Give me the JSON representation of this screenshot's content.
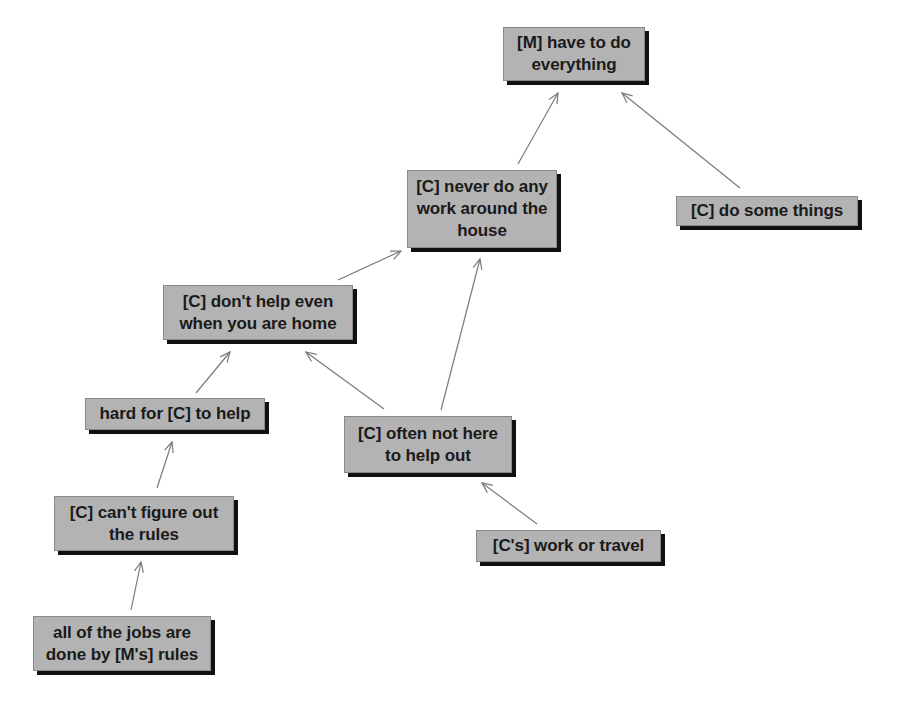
{
  "diagram": {
    "type": "concept-map",
    "colors": {
      "node_fill": "#b3b3b3",
      "node_shadow": "#111111",
      "edge": "#7a7a7a",
      "text": "#1a1a1a"
    },
    "nodes": [
      {
        "id": "n1",
        "label": "[M] have to do everything",
        "lines": [
          "[M] have to do",
          "everything"
        ],
        "x": 503,
        "y": 27,
        "w": 142,
        "h": 54
      },
      {
        "id": "n2",
        "label": "[C] never do any work around the house",
        "lines": [
          "[C] never do any",
          "work around the",
          "house"
        ],
        "x": 407,
        "y": 170,
        "w": 150,
        "h": 78
      },
      {
        "id": "n3",
        "label": "[C] do some things",
        "lines": [
          "[C] do some things"
        ],
        "x": 676,
        "y": 196,
        "w": 182,
        "h": 30
      },
      {
        "id": "n4",
        "label": "[C] don't help even when you are home",
        "lines": [
          "[C] don't help even",
          "when you are home"
        ],
        "x": 163,
        "y": 285,
        "w": 190,
        "h": 55
      },
      {
        "id": "n5",
        "label": "hard for [C] to help",
        "lines": [
          "hard for [C] to help"
        ],
        "x": 85,
        "y": 398,
        "w": 180,
        "h": 32
      },
      {
        "id": "n6",
        "label": "[C] often not here to help out",
        "lines": [
          "[C] often not here",
          "to help out"
        ],
        "x": 344,
        "y": 416,
        "w": 168,
        "h": 57
      },
      {
        "id": "n7",
        "label": "[C] can't figure out the rules",
        "lines": [
          "[C] can't figure out",
          "the rules"
        ],
        "x": 54,
        "y": 496,
        "w": 180,
        "h": 55
      },
      {
        "id": "n8",
        "label": "[C's] work or travel",
        "lines": [
          "[C's] work or travel"
        ],
        "x": 476,
        "y": 530,
        "w": 185,
        "h": 32
      },
      {
        "id": "n9",
        "label": "all of the jobs are done by [M's] rules",
        "lines": [
          "all of the jobs are",
          "done by [M's] rules"
        ],
        "x": 33,
        "y": 616,
        "w": 178,
        "h": 55
      }
    ],
    "edges": [
      {
        "from": "n2",
        "to": "n1",
        "x1": 518,
        "y1": 164,
        "x2": 558,
        "y2": 93
      },
      {
        "from": "n3",
        "to": "n1",
        "x1": 740,
        "y1": 188,
        "x2": 622,
        "y2": 93
      },
      {
        "from": "n4",
        "to": "n2",
        "x1": 338,
        "y1": 280,
        "x2": 401,
        "y2": 251
      },
      {
        "from": "n6",
        "to": "n2",
        "x1": 441,
        "y1": 410,
        "x2": 480,
        "y2": 259
      },
      {
        "from": "n6",
        "to": "n4",
        "x1": 384,
        "y1": 409,
        "x2": 306,
        "y2": 352
      },
      {
        "from": "n5",
        "to": "n4",
        "x1": 196,
        "y1": 393,
        "x2": 230,
        "y2": 352
      },
      {
        "from": "n7",
        "to": "n5",
        "x1": 157,
        "y1": 488,
        "x2": 172,
        "y2": 442
      },
      {
        "from": "n8",
        "to": "n6",
        "x1": 537,
        "y1": 524,
        "x2": 482,
        "y2": 483
      },
      {
        "from": "n9",
        "to": "n7",
        "x1": 131,
        "y1": 610,
        "x2": 141,
        "y2": 562
      }
    ]
  }
}
